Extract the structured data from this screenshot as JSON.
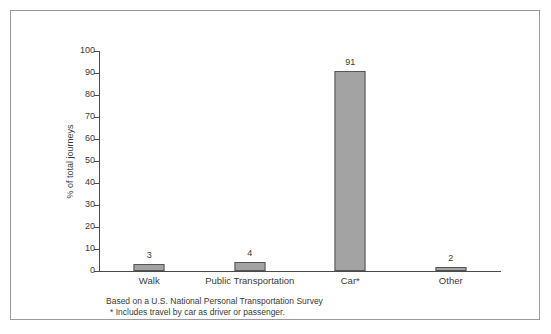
{
  "chart_data": {
    "type": "bar",
    "title": "",
    "subtitle": "",
    "xlabel": "",
    "ylabel": "% of total journeys",
    "categories": [
      "Walk",
      "Public Transportation",
      "Car*",
      "Other"
    ],
    "values": [
      3,
      4,
      91,
      2
    ],
    "value_labels": [
      "3",
      "4",
      "91",
      "2"
    ],
    "ylim": [
      0,
      100
    ],
    "ytick_labels": [
      "100",
      "90",
      "80",
      "70",
      "60",
      "50",
      "40",
      "30",
      "20",
      "10",
      "0"
    ],
    "ytick_values": [
      100,
      90,
      80,
      70,
      60,
      50,
      40,
      30,
      20,
      10,
      0
    ],
    "grid": false,
    "legend": false,
    "legend_position": "none",
    "bar_color": "#a3a3a3",
    "bar_edge_color": "#555555",
    "axis_color": "#4a4a4a",
    "text_color": "#3a3a3a",
    "frame_color": "#9a9a9a",
    "annotations": [
      "Based on a U.S. National Personal Transportation Survey",
      "* Includes travel by car as driver or passenger."
    ]
  },
  "footnotes": {
    "line1": "Based on a U.S. National Personal Transportation Survey",
    "line2": "* Includes travel by car as driver or passenger."
  }
}
